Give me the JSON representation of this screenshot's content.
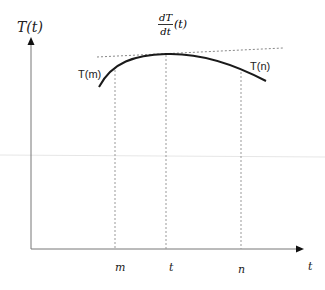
{
  "diagram": {
    "y_axis_label": "T(t)",
    "x_axis_label": "t",
    "derivative_label": {
      "numerator": "dT",
      "denominator": "dt",
      "argument": "(t)"
    },
    "curve_labels": {
      "left": "T(m)",
      "right": "T(n)"
    },
    "x_ticks": [
      {
        "label": "m",
        "x": 115
      },
      {
        "label": "t",
        "x": 166
      },
      {
        "label": "n",
        "x": 241
      }
    ],
    "colors": {
      "curve": "#1a1a1a",
      "axis": "#666666",
      "dashed": "#999999",
      "background": "#ffffff"
    }
  }
}
